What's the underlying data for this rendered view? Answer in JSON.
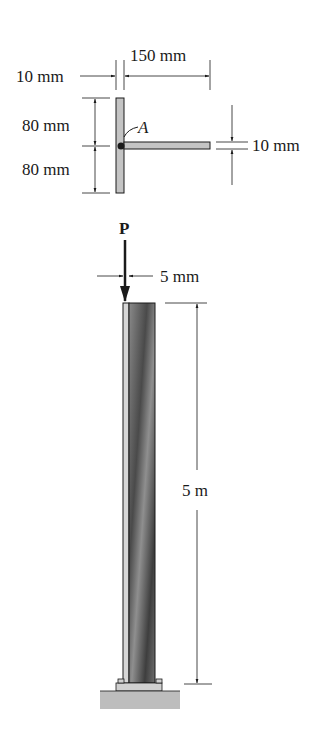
{
  "figure": {
    "cross_section": {
      "labels": {
        "flange_thickness": "10 mm",
        "web_length": "150 mm",
        "upper_half_height": "80 mm",
        "lower_half_height": "80 mm",
        "web_thickness": "10 mm",
        "point": "A"
      }
    },
    "column": {
      "labels": {
        "load": "P",
        "eccentricity": "5 mm",
        "length": "5 m"
      }
    },
    "colors": {
      "line": "#1a1a1a",
      "section_fill": "#c4c4c4",
      "column_dark": "#555555",
      "column_light": "#d6d6d6",
      "ground": "#bdbdbd"
    }
  }
}
